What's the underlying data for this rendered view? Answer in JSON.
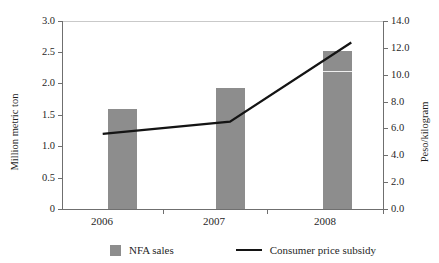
{
  "chart_data": {
    "type": "bar",
    "title": "",
    "subtitle": "",
    "categories": [
      "2006",
      "2007",
      "2008"
    ],
    "series": [
      {
        "name": "NFA sales",
        "type": "bar",
        "axis": "left",
        "unit": "Million metric ton",
        "color": "#8d8d8d",
        "values": [
          1.6,
          1.93,
          2.52
        ]
      },
      {
        "name": "Consumer price subsidy",
        "type": "line",
        "axis": "right",
        "unit": "Peso/kilogram",
        "color": "#141414",
        "values": [
          5.6,
          6.5,
          12.4
        ]
      }
    ],
    "xlabel": "",
    "ylabel": "Million metric ton",
    "y2label": "Peso/kilogram",
    "ylim": [
      0,
      3.0
    ],
    "y2lim": [
      0.0,
      14.0
    ],
    "yticks": [
      "0",
      "0.5",
      "1.0",
      "1.5",
      "2.0",
      "2.5",
      "3.0"
    ],
    "ytick_values": [
      0,
      0.5,
      1.0,
      1.5,
      2.0,
      2.5,
      3.0
    ],
    "y2ticks": [
      "0.0",
      "2.0",
      "4.0",
      "6.0",
      "8.0",
      "10.0",
      "12.0",
      "14.0"
    ],
    "y2tick_values": [
      0,
      2,
      4,
      6,
      8,
      10,
      12,
      14
    ],
    "grid": false,
    "legend_position": "bottom"
  },
  "axes": {
    "left": {
      "title": "Million metric ton",
      "ticks": [
        "0",
        "0.5",
        "1.0",
        "1.5",
        "2.0",
        "2.5",
        "3.0"
      ]
    },
    "right": {
      "title": "Peso/kilogram",
      "ticks": [
        "0.0",
        "2.0",
        "4.0",
        "6.0",
        "8.0",
        "10.0",
        "12.0",
        "14.0"
      ]
    },
    "x": {
      "ticks": [
        "2006",
        "2007",
        "2008"
      ]
    }
  },
  "legend": {
    "bars_label": "NFA sales",
    "line_label": "Consumer price subsidy"
  },
  "artifacts": {
    "top_caption_remnant": ""
  }
}
